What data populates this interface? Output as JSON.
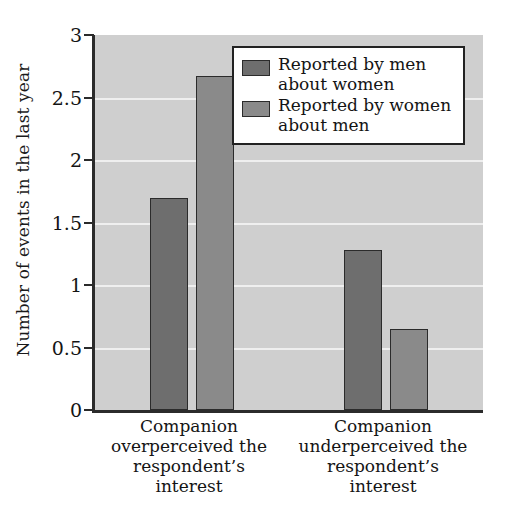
{
  "chart_data": {
    "type": "bar",
    "title": "",
    "xlabel": "",
    "ylabel": "Number of events in the last year",
    "ylim": [
      0,
      3
    ],
    "yticks": [
      "0",
      "0.5",
      "1",
      "1.5",
      "2",
      "2.5",
      "3"
    ],
    "ytick_values": [
      0,
      0.5,
      1,
      1.5,
      2,
      2.5,
      3
    ],
    "grid": true,
    "legend_position": "top-right",
    "categories": [
      "Companion overperceived the respondent's interest",
      "Companion underperceived the respondent's interest"
    ],
    "series": [
      {
        "name": "Reported by men about women",
        "color": "#6e6e6e",
        "values": [
          1.7,
          1.28
        ]
      },
      {
        "name": "Reported by women about men",
        "color": "#8a8a8a",
        "values": [
          2.67,
          0.65
        ]
      }
    ]
  },
  "axis": {
    "y_title": "Number of events in the last year",
    "tick_labels": [
      "3",
      "2.5",
      "2",
      "1.5",
      "1",
      "0.5",
      "0"
    ]
  },
  "legend": {
    "entries": [
      {
        "line1": "Reported by men",
        "line2": "about women"
      },
      {
        "line1": "Reported by women",
        "line2": "about men"
      }
    ]
  },
  "categories": [
    {
      "line1": "Companion",
      "line2": "overperceived the",
      "line3": "respondent’s",
      "line4": "interest"
    },
    {
      "line1": "Companion",
      "line2": "underperceived the",
      "line3": "respondent’s",
      "line4": "interest"
    }
  ],
  "colors": {
    "plot_background": "#cfcfcf",
    "gridline": "#efefef",
    "axis": "#2b2b2b",
    "series_men": "#6e6e6e",
    "series_women": "#8a8a8a"
  }
}
